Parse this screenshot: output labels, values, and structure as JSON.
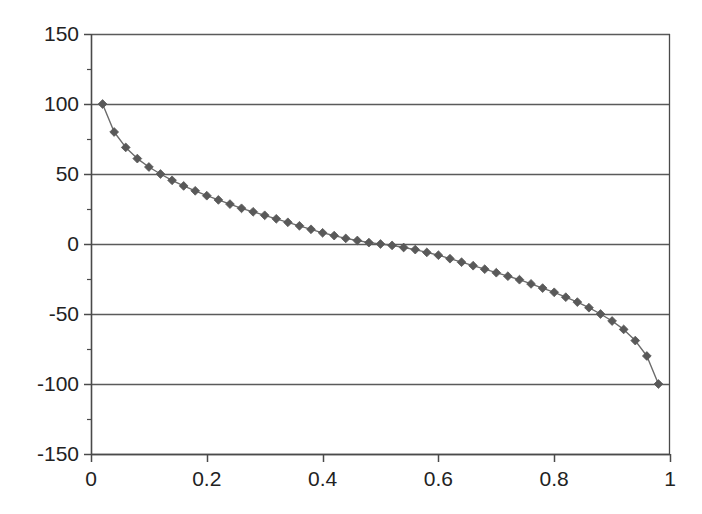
{
  "chart_data": {
    "type": "line",
    "title": "",
    "subtitle": "",
    "xlabel": "",
    "ylabel": "",
    "xlim": [
      0,
      1
    ],
    "ylim": [
      -150,
      150
    ],
    "grid": true,
    "grid_axis": "y",
    "legend": false,
    "legend_position": "none",
    "marker": "diamond",
    "marker_color": "#595959",
    "line_color": "#6b6b6b",
    "axis_color": "#4a4a4a",
    "gridline_color": "#5a5a5a",
    "background_color": "#ffffff",
    "x_ticks": [
      0,
      0.2,
      0.4,
      0.6,
      0.8,
      1
    ],
    "x_tick_labels": [
      "0",
      "0.2",
      "0.4",
      "0.6",
      "0.8",
      "1"
    ],
    "y_ticks": [
      150,
      100,
      50,
      0,
      -50,
      -100,
      -150
    ],
    "y_tick_labels": [
      "150",
      "100",
      "50",
      "0",
      "-50",
      "-100",
      "-150"
    ],
    "y_minor_ticks": [
      125,
      75,
      25,
      -25,
      -75,
      -125
    ],
    "series": [
      {
        "name": "series-1",
        "x": [
          0.02,
          0.04,
          0.06,
          0.08,
          0.1,
          0.12,
          0.14,
          0.16,
          0.18,
          0.2,
          0.22,
          0.24,
          0.26,
          0.28,
          0.3,
          0.32,
          0.34,
          0.36,
          0.38,
          0.4,
          0.42,
          0.44,
          0.46,
          0.48,
          0.5,
          0.52,
          0.54,
          0.56,
          0.58,
          0.6,
          0.62,
          0.64,
          0.66,
          0.68,
          0.7,
          0.72,
          0.74,
          0.76,
          0.78,
          0.8,
          0.82,
          0.84,
          0.86,
          0.88,
          0.9,
          0.92,
          0.94,
          0.96,
          0.98
        ],
        "y": [
          100.0,
          80.0,
          69.0,
          61.0,
          55.0,
          50.0,
          45.5,
          41.5,
          38.0,
          34.5,
          31.5,
          28.5,
          25.5,
          23.0,
          20.5,
          18.0,
          15.5,
          13.0,
          10.5,
          8.0,
          6.0,
          4.0,
          2.5,
          1.0,
          0.0,
          -1.0,
          -2.5,
          -4.0,
          -6.0,
          -8.0,
          -10.5,
          -13.0,
          -15.5,
          -18.0,
          -20.5,
          -23.0,
          -25.5,
          -28.5,
          -31.5,
          -34.5,
          -38.0,
          -41.5,
          -45.5,
          -50.0,
          -55.0,
          -61.0,
          -69.0,
          -80.0,
          -100.0
        ]
      }
    ]
  },
  "axes": {
    "plot_left_px": 91,
    "plot_right_px": 670,
    "plot_top_px": 34,
    "plot_bottom_px": 454
  }
}
